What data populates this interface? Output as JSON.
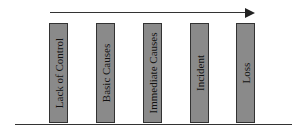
{
  "diagram": {
    "type": "domino-sequence",
    "arrow": {
      "direction": "right"
    },
    "bars": [
      {
        "label": "Lack of Control",
        "x": 49
      },
      {
        "label": "Basic Causes",
        "x": 96
      },
      {
        "label": "Immediate Causes",
        "x": 143
      },
      {
        "label": "Incident",
        "x": 190
      },
      {
        "label": "Loss",
        "x": 236
      }
    ],
    "colors": {
      "bar_fill": "#8a8a8a",
      "border": "#333333",
      "text": "#111111"
    }
  }
}
